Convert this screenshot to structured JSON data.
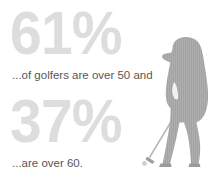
{
  "canvas": {
    "width": 220,
    "height": 187,
    "background_color": "#ffffff"
  },
  "colors": {
    "percent_gray": "#dddddd",
    "caption_gray": "#575757",
    "silhouette_gray": "#a0a0a0",
    "silhouette_texture": "#b4b4b4"
  },
  "stats": [
    {
      "percent": "61%",
      "caption": "...of golfers are over 50 and",
      "value": 61,
      "age_threshold": 50
    },
    {
      "percent": "37%",
      "caption": "...are over 60.",
      "value": 37,
      "age_threshold": 60
    }
  ],
  "illustration": {
    "subject": "golfer-silhouette",
    "description": "golfer-putting-stance"
  }
}
